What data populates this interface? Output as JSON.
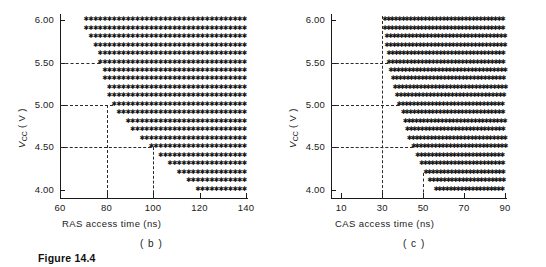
{
  "figure": {
    "caption": "Figure 14.4"
  },
  "panels": [
    {
      "id": "b",
      "sublabel": "( b )",
      "chart_data": {
        "type": "scatter",
        "title": "",
        "xlabel": "RAS access time (ns)",
        "ylabel": "Vcc (V)",
        "ylabel_parts": {
          "base": "V",
          "sub": "CC",
          "unit": "( V )"
        },
        "xlim": [
          60,
          140
        ],
        "ylim": [
          3.9,
          6.05
        ],
        "xticks": [
          60,
          80,
          100,
          120,
          140
        ],
        "xticklabels": [
          "60",
          "80",
          "100",
          "120",
          "140"
        ],
        "yticks": [
          4.0,
          4.5,
          5.0,
          5.5,
          6.0
        ],
        "yticklabels": [
          "4.00",
          "4.50",
          "5.00",
          "5.50",
          "6.00"
        ],
        "grid": false,
        "legend": false,
        "marker": "asterisk",
        "guides": {
          "horizontal": [
            5.5,
            5.0,
            4.5
          ],
          "vertical": [
            80,
            100
          ]
        },
        "rows": [
          {
            "vcc": 6.0,
            "x_start": 71,
            "x_end": 140
          },
          {
            "vcc": 5.9,
            "x_start": 71,
            "x_end": 140
          },
          {
            "vcc": 5.8,
            "x_start": 73,
            "x_end": 140
          },
          {
            "vcc": 5.7,
            "x_start": 75,
            "x_end": 140
          },
          {
            "vcc": 5.6,
            "x_start": 77,
            "x_end": 140
          },
          {
            "vcc": 5.5,
            "x_start": 77,
            "x_end": 140
          },
          {
            "vcc": 5.4,
            "x_start": 79,
            "x_end": 140
          },
          {
            "vcc": 5.3,
            "x_start": 79,
            "x_end": 140
          },
          {
            "vcc": 5.2,
            "x_start": 81,
            "x_end": 140
          },
          {
            "vcc": 5.1,
            "x_start": 81,
            "x_end": 140
          },
          {
            "vcc": 5.0,
            "x_start": 83,
            "x_end": 140
          },
          {
            "vcc": 4.9,
            "x_start": 85,
            "x_end": 140
          },
          {
            "vcc": 4.8,
            "x_start": 89,
            "x_end": 140
          },
          {
            "vcc": 4.7,
            "x_start": 91,
            "x_end": 140
          },
          {
            "vcc": 4.6,
            "x_start": 95,
            "x_end": 140
          },
          {
            "vcc": 4.5,
            "x_start": 99,
            "x_end": 140
          },
          {
            "vcc": 4.4,
            "x_start": 103,
            "x_end": 140
          },
          {
            "vcc": 4.3,
            "x_start": 107,
            "x_end": 140
          },
          {
            "vcc": 4.2,
            "x_start": 111,
            "x_end": 140
          },
          {
            "vcc": 4.1,
            "x_start": 115,
            "x_end": 140
          },
          {
            "vcc": 4.0,
            "x_start": 119,
            "x_end": 140
          }
        ]
      }
    },
    {
      "id": "c",
      "sublabel": "( c )",
      "chart_data": {
        "type": "scatter",
        "title": "",
        "xlabel": "CAS access time (ns)",
        "ylabel": "Vcc (V)",
        "ylabel_parts": {
          "base": "V",
          "sub": "CC",
          "unit": "( V )"
        },
        "xlim": [
          5,
          90
        ],
        "ylim": [
          3.9,
          6.05
        ],
        "xticks": [
          10,
          30,
          50,
          70,
          90
        ],
        "xticklabels": [
          "10",
          "30",
          "50",
          "70",
          "90"
        ],
        "yticks": [
          4.0,
          4.5,
          5.0,
          5.5,
          6.0
        ],
        "yticklabels": [
          "4.00",
          "4.50",
          "5.00",
          "5.50",
          "6.00"
        ],
        "grid": false,
        "legend": false,
        "marker": "asterisk",
        "guides": {
          "horizontal": [
            5.5,
            5.0,
            4.5
          ],
          "vertical": [
            30,
            50
          ]
        },
        "rows": [
          {
            "vcc": 6.0,
            "x_start": 31,
            "x_end": 90
          },
          {
            "vcc": 5.9,
            "x_start": 31,
            "x_end": 90
          },
          {
            "vcc": 5.8,
            "x_start": 32,
            "x_end": 90
          },
          {
            "vcc": 5.7,
            "x_start": 32,
            "x_end": 90
          },
          {
            "vcc": 5.6,
            "x_start": 33,
            "x_end": 90
          },
          {
            "vcc": 5.5,
            "x_start": 33,
            "x_end": 90
          },
          {
            "vcc": 5.4,
            "x_start": 34,
            "x_end": 90
          },
          {
            "vcc": 5.3,
            "x_start": 35,
            "x_end": 90
          },
          {
            "vcc": 5.2,
            "x_start": 36,
            "x_end": 90
          },
          {
            "vcc": 5.1,
            "x_start": 37,
            "x_end": 90
          },
          {
            "vcc": 5.0,
            "x_start": 38,
            "x_end": 90
          },
          {
            "vcc": 4.9,
            "x_start": 40,
            "x_end": 90
          },
          {
            "vcc": 4.8,
            "x_start": 41,
            "x_end": 90
          },
          {
            "vcc": 4.7,
            "x_start": 42,
            "x_end": 90
          },
          {
            "vcc": 4.6,
            "x_start": 43,
            "x_end": 90
          },
          {
            "vcc": 4.5,
            "x_start": 45,
            "x_end": 90
          },
          {
            "vcc": 4.4,
            "x_start": 47,
            "x_end": 90
          },
          {
            "vcc": 4.3,
            "x_start": 49,
            "x_end": 90
          },
          {
            "vcc": 4.2,
            "x_start": 51,
            "x_end": 90
          },
          {
            "vcc": 4.1,
            "x_start": 53,
            "x_end": 90
          },
          {
            "vcc": 4.0,
            "x_start": 56,
            "x_end": 90
          }
        ]
      }
    }
  ]
}
